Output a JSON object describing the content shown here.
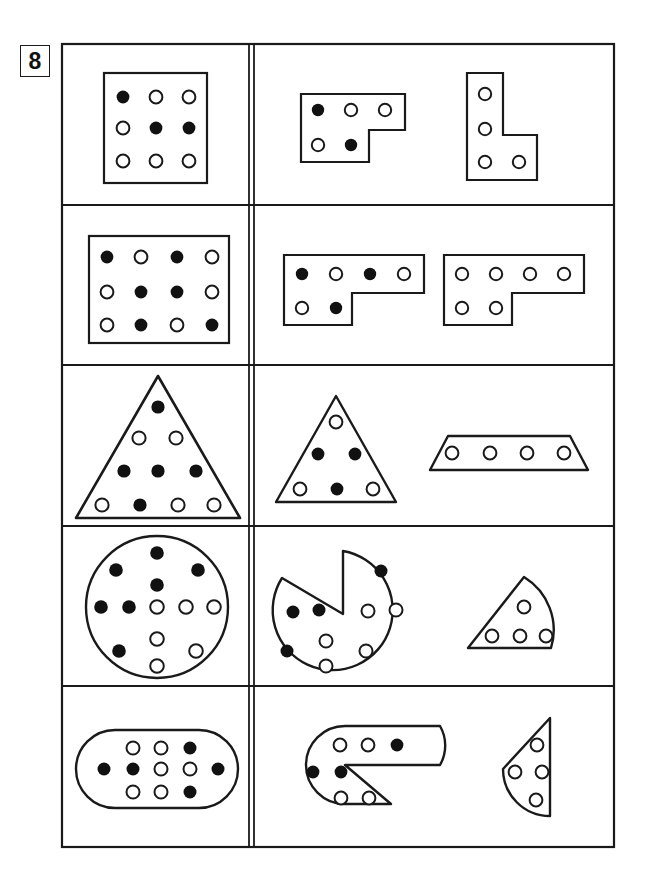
{
  "page": {
    "number": "8",
    "background_color": "#ffffff",
    "ink_color": "#1a1a1a",
    "dot_fill_color": "#111111",
    "dot_open_color": "#ffffff"
  },
  "grid": {
    "x": 62,
    "y": 44,
    "width": 552,
    "height": 803,
    "column_divider_x": 251,
    "row_boundaries": [
      44,
      205,
      365,
      526,
      686,
      847
    ],
    "rows": 5,
    "columns": 2
  },
  "legend": {
    "filled_label": "filled-dot",
    "open_label": "open-dot"
  },
  "rows": [
    {
      "id": "row-1",
      "left": {
        "shape": "rectangle",
        "shape_label": "3-by-3 dot rectangle",
        "dot_rows": [
          [
            "filled",
            "open",
            "open"
          ],
          [
            "open",
            "filled",
            "filled"
          ],
          [
            "open",
            "open",
            "open"
          ]
        ],
        "total_dots": 9,
        "filled_count": 3,
        "open_count": 6
      },
      "right": [
        {
          "shape": "l-piece-horizontal",
          "shape_label": "L piece, 3 on top row and 2 on bottom row",
          "dot_rows": [
            [
              "filled",
              "open",
              "open"
            ],
            [
              "open",
              "filled"
            ]
          ],
          "total_dots": 5,
          "filled_count": 2,
          "open_count": 3
        },
        {
          "shape": "l-piece-vertical",
          "shape_label": "L piece standing upright",
          "dot_rows": [
            [
              "open"
            ],
            [
              "open"
            ],
            [
              "open",
              "open"
            ]
          ],
          "total_dots": 4,
          "filled_count": 0,
          "open_count": 4
        }
      ]
    },
    {
      "id": "row-2",
      "left": {
        "shape": "rectangle",
        "shape_label": "4-by-3 dot rectangle",
        "dot_rows": [
          [
            "filled",
            "open",
            "filled",
            "open"
          ],
          [
            "open",
            "filled",
            "filled",
            "open"
          ],
          [
            "open",
            "filled",
            "open",
            "filled"
          ]
        ],
        "total_dots": 12,
        "filled_count": 6,
        "open_count": 6
      },
      "right": [
        {
          "shape": "l-piece-wide",
          "shape_label": "wide L piece, 4 on top row and 2 on bottom row",
          "dot_rows": [
            [
              "filled",
              "open",
              "filled",
              "open"
            ],
            [
              "open",
              "filled"
            ]
          ],
          "total_dots": 6,
          "filled_count": 3,
          "open_count": 3
        },
        {
          "shape": "l-piece-wide",
          "shape_label": "wide L piece, all open dots",
          "dot_rows": [
            [
              "open",
              "open",
              "open",
              "open"
            ],
            [
              "open",
              "open"
            ]
          ],
          "total_dots": 6,
          "filled_count": 0,
          "open_count": 6
        }
      ]
    },
    {
      "id": "row-3",
      "left": {
        "shape": "triangle",
        "shape_label": "large triangle with four dot rows",
        "dot_rows": [
          [
            "filled"
          ],
          [
            "open",
            "open"
          ],
          [
            "filled",
            "filled",
            "filled"
          ],
          [
            "open",
            "filled",
            "open",
            "open"
          ]
        ],
        "total_dots": 10,
        "filled_count": 5,
        "open_count": 5
      },
      "right": [
        {
          "shape": "triangle",
          "shape_label": "small triangle with three dot rows",
          "dot_rows": [
            [
              "open"
            ],
            [
              "filled",
              "filled"
            ],
            [
              "open",
              "filled",
              "open"
            ]
          ],
          "total_dots": 6,
          "filled_count": 3,
          "open_count": 3
        },
        {
          "shape": "trapezoid",
          "shape_label": "trapezoid strip with four open dots",
          "dot_rows": [
            [
              "open",
              "open",
              "open",
              "open"
            ]
          ],
          "total_dots": 4,
          "filled_count": 0,
          "open_count": 4
        }
      ]
    },
    {
      "id": "row-4",
      "left": {
        "shape": "circle",
        "shape_label": "circle with thirteen dots",
        "dot_rows": [
          [
            "filled"
          ],
          [
            "filled",
            "filled"
          ],
          [
            "filled"
          ],
          [
            "filled",
            "filled",
            "open",
            "open",
            "open"
          ],
          [
            "open"
          ],
          [
            "filled",
            "open"
          ],
          [
            "open"
          ]
        ],
        "total_dots": 13,
        "filled_count": 7,
        "open_count": 6
      },
      "right": [
        {
          "shape": "circle-with-wedge-removed",
          "shape_label": "circle with a wedge cut out",
          "dot_rows": [
            [
              "filled"
            ],
            [
              "filled",
              "filled"
            ],
            [
              "open",
              "open"
            ],
            [
              "open"
            ],
            [
              "filled",
              "open"
            ],
            [
              "open"
            ]
          ],
          "total_dots": 9,
          "filled_count": 4,
          "open_count": 5
        },
        {
          "shape": "wedge",
          "shape_label": "wedge piece with four open dots",
          "dot_rows": [
            [
              "open"
            ],
            [
              "open",
              "open",
              "open"
            ]
          ],
          "total_dots": 4,
          "filled_count": 0,
          "open_count": 4
        }
      ]
    },
    {
      "id": "row-5",
      "left": {
        "shape": "stadium",
        "shape_label": "rounded capsule with eleven dots",
        "dot_rows": [
          [
            "open",
            "open",
            "filled"
          ],
          [
            "filled",
            "filled",
            "open",
            "open",
            "filled"
          ],
          [
            "open",
            "open",
            "filled"
          ]
        ],
        "total_dots": 11,
        "filled_count": 5,
        "open_count": 6
      },
      "right": [
        {
          "shape": "stadium-with-wedge-removed",
          "shape_label": "rounded capsule with a wedge cut out",
          "dot_rows": [
            [
              "open",
              "open",
              "filled"
            ],
            [
              "filled",
              "filled"
            ],
            [
              "open",
              "open"
            ]
          ],
          "total_dots": 7,
          "filled_count": 3,
          "open_count": 4
        },
        {
          "shape": "rounded-wedge",
          "shape_label": "rounded wedge piece with four open dots",
          "dot_rows": [
            [
              "open"
            ],
            [
              "open",
              "open"
            ],
            [
              "open"
            ]
          ],
          "total_dots": 4,
          "filled_count": 0,
          "open_count": 4
        }
      ]
    }
  ]
}
